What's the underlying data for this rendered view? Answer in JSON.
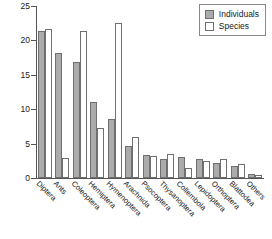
{
  "chart_data": {
    "type": "bar",
    "title": "",
    "xlabel": "",
    "ylabel": "Percentage",
    "ylim": [
      0,
      25
    ],
    "yticks": [
      0,
      5,
      10,
      15,
      20,
      25
    ],
    "grid": false,
    "legend_position": "top-right",
    "categories": [
      "Diptera",
      "Ants",
      "Coleoptera",
      "Hemiptera",
      "Hymenoptera",
      "Arachnida",
      "Psocoptera",
      "Thysanoptera",
      "Collembola",
      "Lepidoptera",
      "Orthoptera",
      "Blattodea",
      "Others"
    ],
    "series": [
      {
        "name": "Individuals",
        "color": "#ababab",
        "values": [
          21.4,
          18.2,
          16.8,
          11.1,
          8.6,
          4.7,
          3.4,
          2.8,
          3.0,
          2.8,
          2.2,
          1.7,
          0.6
        ]
      },
      {
        "name": "Species",
        "color": "#ffffff",
        "values": [
          21.6,
          2.9,
          21.3,
          7.2,
          22.6,
          5.9,
          3.2,
          3.5,
          1.5,
          2.5,
          2.7,
          2.0,
          0.4
        ]
      }
    ]
  },
  "legend": {
    "items": [
      {
        "label": "Individuals"
      },
      {
        "label": "Species"
      }
    ]
  }
}
